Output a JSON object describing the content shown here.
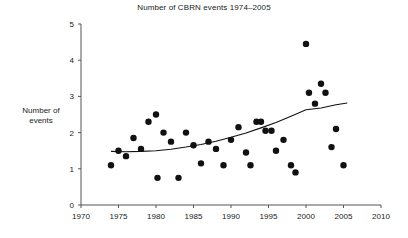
{
  "chart_data": {
    "type": "scatter",
    "title": "Number of CBRN events 1974–2005",
    "xlabel": "",
    "ylabel": "Number of\nevents",
    "xlim": [
      1970,
      2010
    ],
    "ylim": [
      0,
      5
    ],
    "xticks": [
      1970,
      1975,
      1980,
      1985,
      1990,
      1995,
      2000,
      2005,
      2010
    ],
    "xtick_labels": [
      "1970",
      "1975",
      "1980",
      "1985",
      "1990",
      "1995",
      "2000",
      "2005",
      "2010"
    ],
    "yticks": [
      0,
      1,
      2,
      3,
      4,
      5
    ],
    "ytick_labels": [
      "0",
      "1",
      "2",
      "3",
      "4",
      "5"
    ],
    "grid": false,
    "legend": false,
    "marker": "filled-circle",
    "marker_color": "#111111",
    "marker_size": 4.4,
    "axis_color": "#555555",
    "trend_color": "#111111",
    "points": [
      {
        "x": 1974.0,
        "y": 1.1
      },
      {
        "x": 1975.0,
        "y": 1.5
      },
      {
        "x": 1976.0,
        "y": 1.35
      },
      {
        "x": 1977.0,
        "y": 1.85
      },
      {
        "x": 1978.0,
        "y": 1.55
      },
      {
        "x": 1979.0,
        "y": 2.3
      },
      {
        "x": 1980.0,
        "y": 2.5
      },
      {
        "x": 1980.2,
        "y": 0.75
      },
      {
        "x": 1981.0,
        "y": 2.0
      },
      {
        "x": 1982.0,
        "y": 1.75
      },
      {
        "x": 1983.0,
        "y": 0.75
      },
      {
        "x": 1984.0,
        "y": 2.0
      },
      {
        "x": 1985.0,
        "y": 1.65
      },
      {
        "x": 1986.0,
        "y": 1.15
      },
      {
        "x": 1987.0,
        "y": 1.75
      },
      {
        "x": 1988.0,
        "y": 1.55
      },
      {
        "x": 1989.0,
        "y": 1.1
      },
      {
        "x": 1990.0,
        "y": 1.8
      },
      {
        "x": 1991.0,
        "y": 2.15
      },
      {
        "x": 1992.0,
        "y": 1.45
      },
      {
        "x": 1992.6,
        "y": 1.1
      },
      {
        "x": 1993.4,
        "y": 2.3
      },
      {
        "x": 1994.0,
        "y": 2.3
      },
      {
        "x": 1994.6,
        "y": 2.05
      },
      {
        "x": 1995.4,
        "y": 2.05
      },
      {
        "x": 1996.0,
        "y": 1.5
      },
      {
        "x": 1997.0,
        "y": 1.8
      },
      {
        "x": 1998.0,
        "y": 1.1
      },
      {
        "x": 1998.6,
        "y": 0.9
      },
      {
        "x": 2000.0,
        "y": 4.45
      },
      {
        "x": 2000.4,
        "y": 3.1
      },
      {
        "x": 2001.2,
        "y": 2.8
      },
      {
        "x": 2002.0,
        "y": 3.35
      },
      {
        "x": 2002.6,
        "y": 3.1
      },
      {
        "x": 2003.4,
        "y": 1.6
      },
      {
        "x": 2004.0,
        "y": 2.1
      },
      {
        "x": 2005.0,
        "y": 1.1
      }
    ],
    "trend_line": {
      "type": "quadratic-fit",
      "x_start": 1974,
      "x_end": 2005.5,
      "y_start": 1.48,
      "y_end": 2.82,
      "points": [
        {
          "x": 1974.0,
          "y": 1.48
        },
        {
          "x": 1976.0,
          "y": 1.47
        },
        {
          "x": 1978.0,
          "y": 1.48
        },
        {
          "x": 1980.0,
          "y": 1.5
        },
        {
          "x": 1982.0,
          "y": 1.54
        },
        {
          "x": 1984.0,
          "y": 1.6
        },
        {
          "x": 1986.0,
          "y": 1.67
        },
        {
          "x": 1988.0,
          "y": 1.76
        },
        {
          "x": 1990.0,
          "y": 1.87
        },
        {
          "x": 1992.0,
          "y": 1.99
        },
        {
          "x": 1994.0,
          "y": 2.13
        },
        {
          "x": 1996.0,
          "y": 2.28
        },
        {
          "x": 1998.0,
          "y": 2.45
        },
        {
          "x": 2000.0,
          "y": 2.63
        },
        {
          "x": 2002.0,
          "y": 2.68
        },
        {
          "x": 2004.0,
          "y": 2.77
        },
        {
          "x": 2005.5,
          "y": 2.82
        }
      ]
    }
  }
}
